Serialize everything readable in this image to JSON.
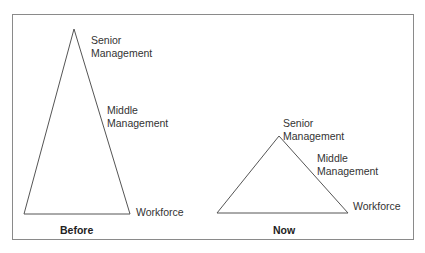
{
  "diagram": {
    "border_color": "#8a8a8a",
    "line_color": "#555555",
    "before": {
      "caption": "Before",
      "labels": {
        "senior_line1": "Senior",
        "senior_line2": "Management",
        "middle_line1": "Middle",
        "middle_line2": "Management",
        "workforce": "Workforce"
      },
      "triangle": {
        "apex": [
          74,
          29
        ],
        "base_left": [
          24,
          214
        ],
        "base_right": [
          130,
          214
        ]
      }
    },
    "now": {
      "caption": "Now",
      "labels": {
        "senior_line1": "Senior",
        "senior_line2": "Management",
        "middle_line1": "Middle",
        "middle_line2": "Management",
        "workforce": "Workforce"
      },
      "triangle": {
        "apex": [
          279,
          136
        ],
        "base_left": [
          217,
          213
        ],
        "base_right": [
          348,
          213
        ]
      }
    }
  }
}
